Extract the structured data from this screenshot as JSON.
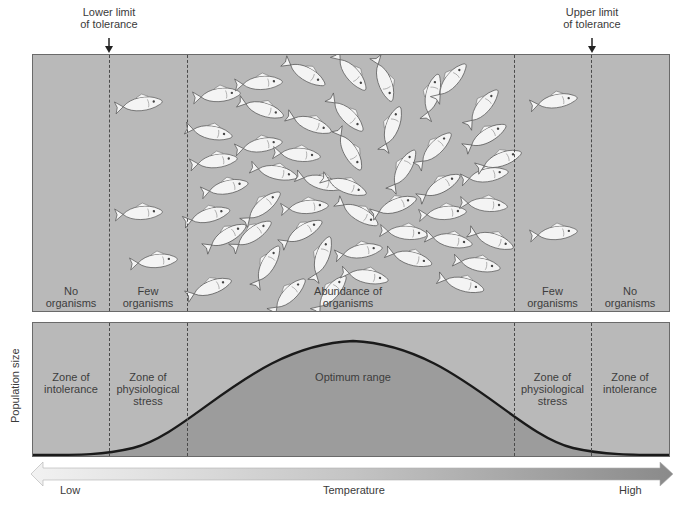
{
  "diagram": {
    "limits": {
      "lower": {
        "line1": "Lower limit",
        "line2": "of tolerance"
      },
      "upper": {
        "line1": "Upper limit",
        "line2": "of tolerance"
      }
    },
    "top_panel": {
      "description": "Illustration of fish density across temperature zones",
      "zones": [
        {
          "line1": "No",
          "line2": "organisms"
        },
        {
          "line1": "Few",
          "line2": "organisms"
        },
        {
          "line1": "Abundance of",
          "line2": "organisms"
        },
        {
          "line1": "Few",
          "line2": "organisms"
        },
        {
          "line1": "No",
          "line2": "organisms"
        }
      ]
    },
    "bottom_panel": {
      "y_axis_label": "Population size",
      "zones": [
        {
          "line1": "Zone of",
          "line2": "intolerance",
          "line3": ""
        },
        {
          "line1": "Zone of",
          "line2": "physiological",
          "line3": "stress"
        },
        {
          "line1": "Optimum range",
          "line2": "",
          "line3": ""
        },
        {
          "line1": "Zone of",
          "line2": "physiological",
          "line3": "stress"
        },
        {
          "line1": "Zone of",
          "line2": "intolerance",
          "line3": ""
        }
      ],
      "curve": "bell-shaped population curve peaking in optimum range"
    },
    "x_axis": {
      "label": "Temperature",
      "low": "Low",
      "high": "High"
    },
    "colors": {
      "panel_fill": "#b9b9b9",
      "optimum_fill": "#9a9a9a",
      "curve": "#1a1a1a",
      "fish": "#f4f4f4",
      "text": "#3a3a3a"
    }
  }
}
